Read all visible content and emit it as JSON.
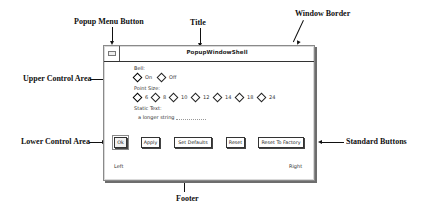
{
  "callouts": {
    "popup_menu_button": "Popup Menu Button",
    "title": "Title",
    "window_border": "Window Border",
    "upper_control_area": "Upper Control Area",
    "lower_control_area": "Lower Control Area",
    "standard_buttons": "Standard Buttons",
    "footer": "Footer"
  },
  "window": {
    "title": "PopupWindowShell",
    "upper": {
      "bell_label": "Bell:",
      "bell_options": [
        {
          "label": "On",
          "selected": true
        },
        {
          "label": "Off",
          "selected": false
        }
      ],
      "point_size_label": "Point Size:",
      "point_size_options": [
        {
          "label": "6",
          "selected": true
        },
        {
          "label": "8",
          "selected": false
        },
        {
          "label": "10",
          "selected": false
        },
        {
          "label": "12",
          "selected": false
        },
        {
          "label": "14",
          "selected": false
        },
        {
          "label": "18",
          "selected": false
        },
        {
          "label": "24",
          "selected": false
        }
      ],
      "static_text_label": "Static Text:",
      "static_text_value": "a longer string"
    },
    "buttons": [
      {
        "label": "Ok",
        "default": true
      },
      {
        "label": "Apply",
        "default": false
      },
      {
        "label": "Set Defaults",
        "default": false
      },
      {
        "label": "Reset",
        "default": false
      },
      {
        "label": "Reset To Factory",
        "default": false
      }
    ],
    "footer": {
      "left": "Left",
      "right": "Right"
    }
  }
}
